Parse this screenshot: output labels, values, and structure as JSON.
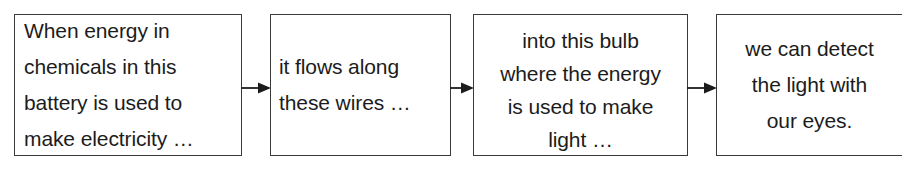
{
  "diagram": {
    "type": "process-flow",
    "orientation": "horizontal",
    "border_color": "#3a3a3a",
    "text_color": "#1c1c1c",
    "background_color": "#ffffff",
    "arrow_color": "#1c1c1c",
    "boxes": [
      {
        "id": "box-1",
        "align": "left",
        "lines": [
          "When energy in",
          "chemicals in this",
          "battery is used to",
          "make electricity …"
        ]
      },
      {
        "id": "box-2",
        "align": "left",
        "lines": [
          "it flows along",
          "these wires …"
        ]
      },
      {
        "id": "box-3",
        "align": "center",
        "lines": [
          "into this bulb",
          "where the energy",
          "is used to make",
          "light …"
        ]
      },
      {
        "id": "box-4",
        "align": "center",
        "lines": [
          "we can detect",
          "the light with",
          "our eyes."
        ]
      }
    ],
    "arrows": [
      {
        "id": "arrow-1",
        "from": "box-1",
        "to": "box-2",
        "direction": "right"
      },
      {
        "id": "arrow-2",
        "from": "box-2",
        "to": "box-3",
        "direction": "right"
      },
      {
        "id": "arrow-3",
        "from": "box-3",
        "to": "box-4",
        "direction": "right"
      }
    ]
  }
}
